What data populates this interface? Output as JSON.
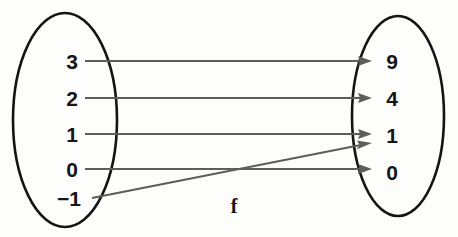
{
  "diagram": {
    "type": "mapping-diagram",
    "function_label": "f",
    "background_color": "#fdfdfc",
    "ellipse_stroke_color": "#141414",
    "arrow_color": "#5d5d5d",
    "text_color": "#15161a",
    "domain": {
      "name": "domain-set",
      "elements": [
        {
          "label": "3",
          "x": 72,
          "y": 61
        },
        {
          "label": "2",
          "x": 72,
          "y": 98
        },
        {
          "label": "1",
          "x": 72,
          "y": 134
        },
        {
          "label": "0",
          "x": 72,
          "y": 169
        },
        {
          "label": "−1",
          "x": 69,
          "y": 198
        }
      ],
      "ellipse": {
        "cx": 65,
        "cy": 120,
        "rx": 52,
        "ry": 107
      }
    },
    "codomain": {
      "name": "codomain-set",
      "elements": [
        {
          "label": "9",
          "x": 392,
          "y": 61
        },
        {
          "label": "4",
          "x": 392,
          "y": 98
        },
        {
          "label": "1",
          "x": 392,
          "y": 135
        },
        {
          "label": "0",
          "x": 392,
          "y": 172
        }
      ],
      "ellipse": {
        "cx": 398,
        "cy": 116,
        "rx": 46,
        "ry": 100
      }
    },
    "mappings": [
      {
        "from": "3",
        "to": "9",
        "x1": 85,
        "y1": 61,
        "x2": 372,
        "y2": 61
      },
      {
        "from": "2",
        "to": "4",
        "x1": 85,
        "y1": 98,
        "x2": 372,
        "y2": 98
      },
      {
        "from": "1",
        "to": "1",
        "x1": 85,
        "y1": 134,
        "x2": 372,
        "y2": 134
      },
      {
        "from": "0",
        "to": "0",
        "x1": 85,
        "y1": 169,
        "x2": 372,
        "y2": 169
      },
      {
        "from": "−1",
        "to": "1",
        "x1": 92,
        "y1": 198,
        "x2": 372,
        "y2": 143
      }
    ]
  }
}
